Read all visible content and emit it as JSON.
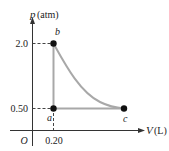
{
  "diagram": {
    "type": "pV-diagram",
    "y_axis": {
      "symbol": "p",
      "unit": "(atm)"
    },
    "x_axis": {
      "symbol": "V",
      "unit": "(L)"
    },
    "origin_label": "O",
    "ticks": {
      "p_high": "2.0",
      "p_low": "0.50",
      "v_low": "0.20"
    },
    "points": [
      {
        "label": "a",
        "p": 0.5,
        "V": 0.2
      },
      {
        "label": "b",
        "p": 2.0,
        "V": 0.2
      },
      {
        "label": "c",
        "p": 0.5,
        "V": 0.8
      }
    ],
    "process_paths": [
      {
        "from": "a",
        "to": "b",
        "kind": "isochoric"
      },
      {
        "from": "b",
        "to": "c",
        "kind": "isothermal curve"
      },
      {
        "from": "c",
        "to": "a",
        "kind": "isobaric"
      }
    ],
    "colors": {
      "axes": "#333333",
      "path": "#a8a8a8",
      "points": "#111111",
      "dashes": "#444444"
    }
  }
}
